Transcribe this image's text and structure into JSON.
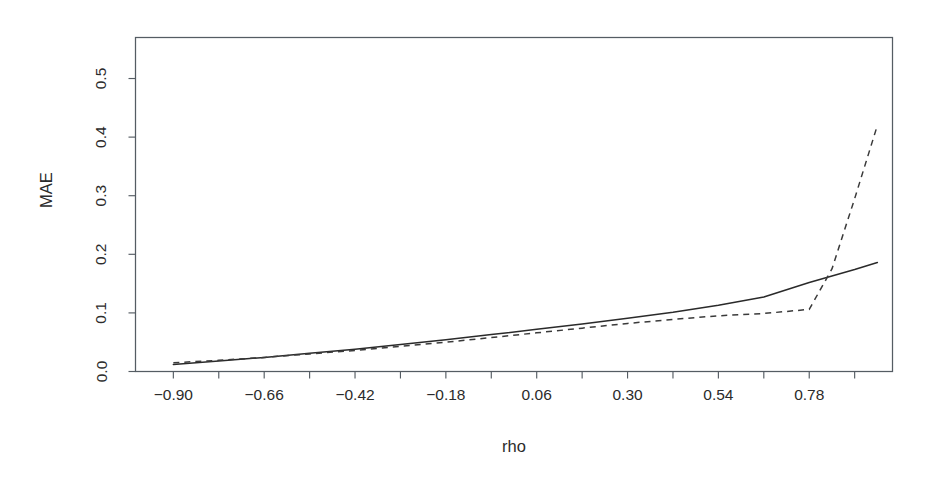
{
  "chart_data": {
    "type": "line",
    "title": "",
    "subtitle": "",
    "xlabel": "rho",
    "ylabel": "MAE",
    "xlim": [
      -1.0,
      1.0
    ],
    "ylim": [
      0.0,
      0.57
    ],
    "grid": false,
    "legend": "none",
    "annotations": [],
    "xticks": [
      -0.9,
      -0.66,
      -0.42,
      -0.18,
      0.06,
      0.3,
      0.54,
      0.78
    ],
    "xtick_labels": [
      "-0.90",
      "-0.66",
      "-0.42",
      "-0.18",
      "0.06",
      "0.30",
      "0.54",
      "0.78"
    ],
    "xminor_ticks": [
      -0.78,
      -0.54,
      -0.3,
      -0.06,
      0.18,
      0.42,
      0.66,
      0.9
    ],
    "yticks": [
      0.0,
      0.1,
      0.2,
      0.3,
      0.4,
      0.5
    ],
    "ytick_labels": [
      "0.0",
      "0.1",
      "0.2",
      "0.3",
      "0.4",
      "0.5"
    ],
    "x": [
      -0.9,
      -0.78,
      -0.66,
      -0.54,
      -0.42,
      -0.3,
      -0.18,
      -0.06,
      0.06,
      0.18,
      0.3,
      0.42,
      0.54,
      0.66,
      0.78,
      0.84,
      0.9,
      0.96
    ],
    "series": [
      {
        "name": "solid",
        "style": "solid",
        "color": "#2a2a2a",
        "values": [
          0.012,
          0.018,
          0.024,
          0.031,
          0.038,
          0.046,
          0.054,
          0.063,
          0.072,
          0.081,
          0.091,
          0.101,
          0.113,
          0.127,
          0.152,
          0.163,
          0.174,
          0.186
        ]
      },
      {
        "name": "dashed",
        "style": "dashed",
        "color": "#3a3a3a",
        "values": [
          0.015,
          0.019,
          0.024,
          0.03,
          0.036,
          0.043,
          0.05,
          0.058,
          0.066,
          0.074,
          0.082,
          0.089,
          0.095,
          0.099,
          0.106,
          0.175,
          0.295,
          0.42
        ]
      }
    ]
  },
  "axes": {
    "y_title": "MAE",
    "x_title": "rho"
  }
}
